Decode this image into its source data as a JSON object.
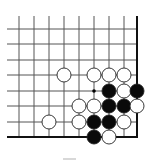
{
  "board": {
    "type": "go-problem-diagram",
    "region": "lower-right-corner",
    "columns_x": [
      19,
      34,
      49,
      64,
      79,
      94,
      109,
      124,
      137
    ],
    "rows_y": [
      29,
      44,
      60,
      75,
      91,
      106,
      122,
      137
    ],
    "line_start": {
      "x": 7,
      "y": 16
    },
    "stone_radius": 7,
    "colors": {
      "background": "#ffffff",
      "grid": "#555555",
      "edge": "#111111",
      "black_stone": "#0a0a0a",
      "white_stone": "#ffffff",
      "stone_outline": "#222222",
      "marker": "#000000"
    },
    "stones": [
      {
        "color": "white",
        "col": 3,
        "row": 3
      },
      {
        "color": "white",
        "col": 5,
        "row": 3
      },
      {
        "color": "white",
        "col": 6,
        "row": 3
      },
      {
        "color": "white",
        "col": 7,
        "row": 3
      },
      {
        "color": "black",
        "col": 6,
        "row": 4
      },
      {
        "color": "white",
        "col": 7,
        "row": 4
      },
      {
        "color": "black",
        "col": 8,
        "row": 4
      },
      {
        "color": "white",
        "col": 4,
        "row": 5
      },
      {
        "color": "white",
        "col": 5,
        "row": 5
      },
      {
        "color": "black",
        "col": 6,
        "row": 5
      },
      {
        "color": "black",
        "col": 7,
        "row": 5
      },
      {
        "color": "white",
        "col": 8,
        "row": 5
      },
      {
        "color": "white",
        "col": 2,
        "row": 6
      },
      {
        "color": "white",
        "col": 4,
        "row": 6
      },
      {
        "color": "black",
        "col": 5,
        "row": 6
      },
      {
        "color": "black",
        "col": 6,
        "row": 6
      },
      {
        "color": "white",
        "col": 7,
        "row": 6
      },
      {
        "color": "black",
        "col": 5,
        "row": 7
      },
      {
        "color": "white",
        "col": 6,
        "row": 7
      }
    ],
    "markers": [
      {
        "type": "dot",
        "col": 5,
        "row": 4
      }
    ]
  },
  "caption": {
    "text": ""
  }
}
